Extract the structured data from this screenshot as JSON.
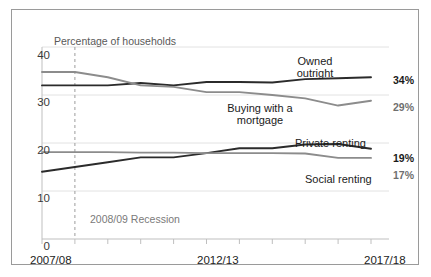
{
  "chart_data": {
    "type": "line",
    "title": "",
    "subtitle": "",
    "xlabel": "",
    "ylabel": "Percentage of households",
    "ylim": [
      0,
      40
    ],
    "ytick_labels": [
      "0",
      "10",
      "20",
      "30",
      "40"
    ],
    "ytick_values": [
      0,
      10,
      20,
      30,
      40
    ],
    "xtick_labels": [
      "2007/08",
      "2012/13",
      "2017/18"
    ],
    "xtick_positions": [
      0,
      5,
      10
    ],
    "x": [
      "2007/08",
      "2008/09",
      "2009/10",
      "2010/11",
      "2011/12",
      "2012/13",
      "2013/14",
      "2014/15",
      "2015/16",
      "2016/17",
      "2017/18"
    ],
    "grid": "horizontal",
    "legend_position": "inline-callouts",
    "series": [
      {
        "name": "Owned outright",
        "color": "#2b2b2b",
        "end_value_label": "34%",
        "values": [
          32.0,
          32.0,
          32.0,
          32.5,
          32.0,
          32.7,
          32.7,
          32.6,
          33.3,
          33.5,
          33.7
        ]
      },
      {
        "name": "Buying with a mortgage",
        "color": "#8c8c8c",
        "end_value_label": "29%",
        "values": [
          34.8,
          34.8,
          33.7,
          32.0,
          31.7,
          30.6,
          30.6,
          30.0,
          29.3,
          27.8,
          28.8
        ]
      },
      {
        "name": "Private renting",
        "color": "#2b2b2b",
        "end_value_label": "19%",
        "values": [
          14.0,
          15.0,
          16.0,
          17.0,
          17.0,
          17.9,
          18.9,
          18.9,
          19.7,
          19.8,
          18.8
        ]
      },
      {
        "name": "Social renting",
        "color": "#8c8c8c",
        "end_value_label": "17%",
        "values": [
          18.1,
          18.1,
          18.1,
          18.0,
          18.0,
          17.9,
          17.9,
          17.9,
          17.8,
          16.9,
          16.9
        ]
      }
    ],
    "annotations": [
      {
        "name": "2008/09 Recession",
        "text": "2008/09 Recession",
        "x_position": 1.0,
        "style": "dashed-vertical-line",
        "color": "#9c9c9c"
      }
    ]
  },
  "axis": {
    "y_title": "Percentage of households",
    "y_ticks": {
      "t40": "40",
      "t30": "30",
      "t20": "20",
      "t10": "10",
      "t0": "0"
    },
    "x_ticks": {
      "start": "2007/08",
      "mid": "2012/13",
      "end": "2017/18"
    }
  },
  "labels": {
    "owned_line1": "Owned",
    "owned_line2": "outright",
    "owned_full": "Owned outright",
    "mortgage_line1": "Buying with a",
    "mortgage_line2": "mortgage",
    "mortgage_full": "Buying with a mortgage",
    "private": "Private renting",
    "social": "Social renting"
  },
  "end_values": {
    "owned": "34%",
    "mortgage": "29%",
    "private": "19%",
    "social": "17%"
  },
  "annotation": {
    "recession": "2008/09 Recession"
  },
  "colors": {
    "dark_series": "#2b2b2b",
    "grey_series": "#8c8c8c",
    "gridline": "#e2e2e2",
    "axis": "#bfbfbf",
    "frame_border": "#9a9a9a",
    "background": "#ffffff",
    "recession_line": "#9c9c9c",
    "muted_text": "#7a7a7a"
  }
}
